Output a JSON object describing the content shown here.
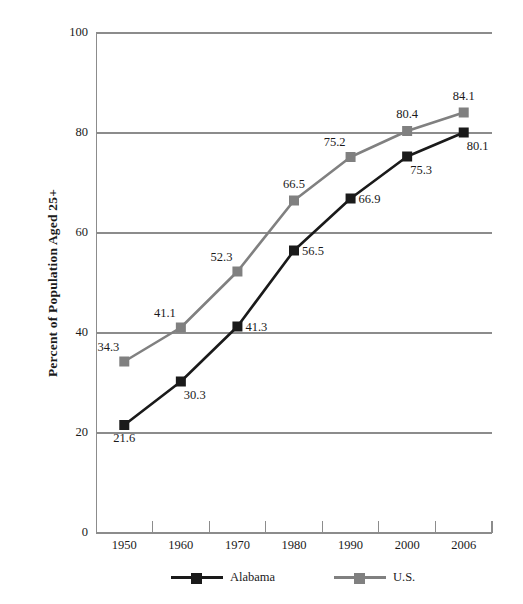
{
  "chart_data": {
    "type": "line",
    "title": "",
    "subtitle": "",
    "xlabel": "",
    "ylabel": "Percent of Population Aged 25+",
    "categories": [
      "1950",
      "1960",
      "1970",
      "1980",
      "1990",
      "2000",
      "2006"
    ],
    "ylim": [
      0,
      100
    ],
    "yticks": [
      "0",
      "20",
      "40",
      "60",
      "80",
      "100"
    ],
    "ytick_values": [
      0,
      20,
      40,
      60,
      80,
      100
    ],
    "grid": true,
    "grid_axis": "y",
    "legend_position": "bottom",
    "series": [
      {
        "name": "Alabama",
        "color": "#1a1a1a",
        "marker": "square",
        "values": [
          21.6,
          30.3,
          41.3,
          56.5,
          66.9,
          75.3,
          80.1
        ],
        "labels": [
          "21.6",
          "30.3",
          "41.3",
          "56.5",
          "66.9",
          "75.3",
          "80.1"
        ],
        "label_positions": [
          "below",
          "below-right",
          "right",
          "right",
          "right",
          "below-right",
          "below-right"
        ]
      },
      {
        "name": "U.S.",
        "color": "#808080",
        "marker": "square",
        "values": [
          34.3,
          41.1,
          52.3,
          66.5,
          75.2,
          80.4,
          84.1
        ],
        "labels": [
          "34.3",
          "41.1",
          "52.3",
          "66.5",
          "75.2",
          "80.4",
          "84.1"
        ],
        "label_positions": [
          "above-left",
          "above-left",
          "above-left",
          "above",
          "above-left",
          "above",
          "above"
        ]
      }
    ]
  },
  "legend": {
    "entries": [
      {
        "label": "Alabama",
        "color": "#1a1a1a"
      },
      {
        "label": "U.S.",
        "color": "#808080"
      }
    ]
  }
}
